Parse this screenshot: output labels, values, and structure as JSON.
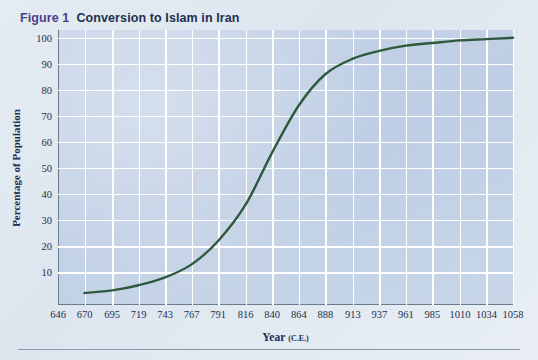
{
  "figure": {
    "label": "Figure 1",
    "title": "Conversion to Islam in Iran",
    "label_color": "#4a3f8c",
    "title_color": "#1d2f4e"
  },
  "chart_data": {
    "type": "line",
    "title": "Conversion to Islam in Iran",
    "xlabel": "Year",
    "xlabel_suffix": "(C.E.)",
    "ylabel": "Percentage of Population",
    "xlim": [
      646,
      1058
    ],
    "ylim": [
      -2.6,
      103
    ],
    "grid": true,
    "legend": "none",
    "line_color": "#2d5a3d",
    "plot_background": "#c3d2e6",
    "gridline_color": "#ffffff",
    "xticks": [
      646,
      670,
      695,
      719,
      743,
      767,
      791,
      816,
      840,
      864,
      888,
      913,
      937,
      961,
      985,
      1010,
      1034,
      1058
    ],
    "yticks": [
      10,
      20,
      30,
      40,
      50,
      60,
      70,
      80,
      90,
      100
    ],
    "x": [
      670,
      695,
      719,
      743,
      767,
      791,
      816,
      840,
      864,
      888,
      913,
      937,
      961,
      985,
      1010,
      1034,
      1058
    ],
    "values": [
      2,
      3,
      5,
      8,
      13,
      22,
      36,
      56,
      74,
      86,
      92,
      95,
      97,
      98,
      99,
      99.5,
      100
    ]
  }
}
